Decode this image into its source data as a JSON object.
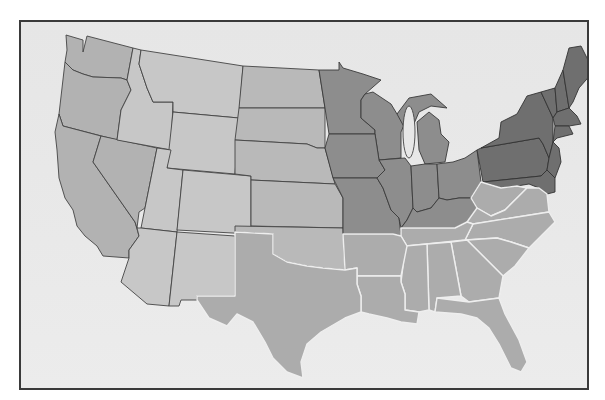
{
  "map": {
    "title": "",
    "subject": "Contiguous United States",
    "style": "grayscale shaded regions",
    "colors": {
      "background": "#ffffff",
      "frame_fill": "#e8e8e8",
      "frame_border": "#3a3a3a",
      "west_region": "#b2b2b2",
      "mountain_region": "#c7c7c7",
      "plains_region": "#b9b9b9",
      "midwest_region": "#8d8d8d",
      "northeast_region": "#6f6f6f",
      "south_region": "#acacac",
      "south_border": "#eeeeee"
    },
    "regions": [
      {
        "name": "West Coast",
        "shade": "medium gray",
        "states": [
          "WA",
          "OR",
          "CA",
          "NV"
        ]
      },
      {
        "name": "Mountain",
        "shade": "light gray",
        "states": [
          "ID",
          "MT",
          "WY",
          "UT",
          "CO",
          "AZ",
          "NM"
        ]
      },
      {
        "name": "Plains",
        "shade": "light-medium gray",
        "states": [
          "ND",
          "SD",
          "NE",
          "KS",
          "OK"
        ]
      },
      {
        "name": "Midwest",
        "shade": "dark gray",
        "states": [
          "MN",
          "IA",
          "MO",
          "WI",
          "IL",
          "MI",
          "IN",
          "OH",
          "KY"
        ]
      },
      {
        "name": "Northeast",
        "shade": "darkest gray",
        "states": [
          "PA",
          "NY",
          "VT",
          "NH",
          "ME",
          "MA",
          "RI",
          "CT",
          "NJ",
          "DE",
          "MD"
        ]
      },
      {
        "name": "South",
        "shade": "light gray with white borders",
        "states": [
          "TX",
          "AR",
          "LA",
          "MS",
          "AL",
          "TN",
          "GA",
          "FL",
          "SC",
          "NC",
          "VA",
          "WV"
        ]
      }
    ],
    "labels": []
  }
}
